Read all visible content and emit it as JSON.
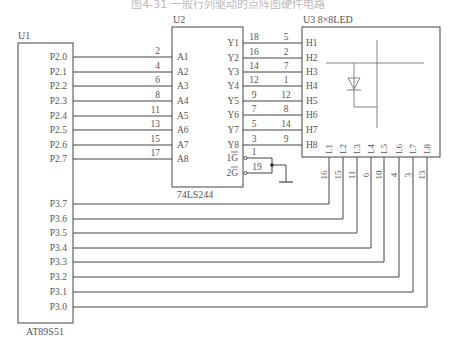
{
  "caption": "图4-31  一般行列驱动的点阵图硬件电路",
  "colors": {
    "line": "#444444",
    "text": "#555555",
    "caption": "#bbbbbb"
  },
  "u1": {
    "ref": "U1",
    "part": "AT89S51",
    "p2_pins": [
      "P2.0",
      "P2.1",
      "P2.2",
      "P2.3",
      "P2.4",
      "P2.5",
      "P2.6",
      "P2.7"
    ],
    "p3_pins": [
      "P3.7",
      "P3.6",
      "P3.5",
      "P3.4",
      "P3.3",
      "P3.2",
      "P3.1",
      "P3.0"
    ]
  },
  "u2": {
    "ref": "U2",
    "part": "74LS244",
    "a_pins": [
      "A1",
      "A2",
      "A3",
      "A4",
      "A5",
      "A6",
      "A7",
      "A8"
    ],
    "a_pin_numbers": [
      "2",
      "4",
      "6",
      "8",
      "11",
      "13",
      "15",
      "17"
    ],
    "y_pins": [
      "Y1",
      "Y2",
      "Y3",
      "Y4",
      "Y5",
      "Y6",
      "Y7",
      "Y8"
    ],
    "y_pin_numbers": [
      "18",
      "16",
      "14",
      "12",
      "9",
      "7",
      "5",
      "3"
    ],
    "g1": "1G",
    "g2": "2G",
    "g1_number": "1",
    "g2_number": "19"
  },
  "u3": {
    "ref": "U3  8×8LED",
    "h_pins": [
      "H1",
      "H2",
      "H3",
      "H4",
      "H5",
      "H6",
      "H7",
      "H8"
    ],
    "h_pin_numbers": [
      "5",
      "2",
      "7",
      "1",
      "12",
      "8",
      "14",
      "9"
    ],
    "l_pins": [
      "L1",
      "L2",
      "L3",
      "L4",
      "L5",
      "L6",
      "L7",
      "L8"
    ],
    "l_pin_numbers": [
      "16",
      "15",
      "11",
      "6",
      "10",
      "4",
      "3",
      "13"
    ]
  }
}
